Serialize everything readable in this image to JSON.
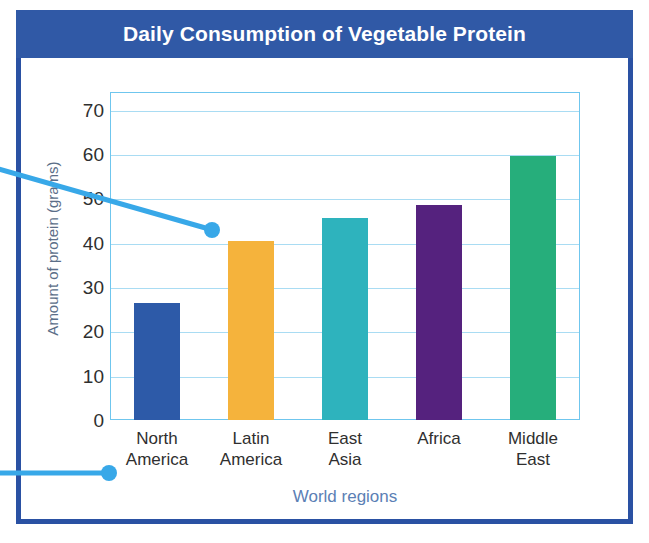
{
  "chart_data": {
    "type": "bar",
    "title": "Daily Consumption of Vegetable Protein",
    "xlabel": "World regions",
    "ylabel": "Amount of protein (grams)",
    "categories": [
      "North America",
      "Latin America",
      "East Asia",
      "Africa",
      "Middle East"
    ],
    "category_lines": [
      [
        "North",
        "America"
      ],
      [
        "Latin",
        "America"
      ],
      [
        "East",
        "Asia"
      ],
      [
        "Africa",
        ""
      ],
      [
        "Middle",
        "East"
      ]
    ],
    "values": [
      26.5,
      40.5,
      45.5,
      48.5,
      59.5
    ],
    "bar_colors": [
      "#2d5aa8",
      "#f5b33c",
      "#2eb3bd",
      "#55227e",
      "#26ae7b"
    ],
    "ylim": [
      0,
      74
    ],
    "yticks": [
      0,
      10,
      20,
      30,
      40,
      50,
      60,
      70
    ],
    "ytick_labels": [
      "0",
      "10",
      "20",
      "30",
      "40",
      "50",
      "60",
      "70"
    ],
    "grid": true,
    "legend": "none"
  },
  "frame": {
    "border_color": "#2a51a3",
    "banner_color": "#3059a6",
    "plot_border_color": "#6fc6ee",
    "gridline_color": "#a9dcf3"
  },
  "annotations": {
    "callout_color": "#38a8e8",
    "pointer_top_target": "Latin America bar top",
    "pointer_bottom_target": "North America category label"
  }
}
